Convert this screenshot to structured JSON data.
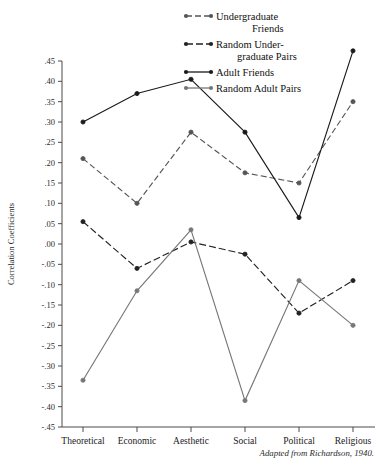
{
  "chart_data": {
    "type": "line",
    "title": "",
    "xlabel": "",
    "ylabel": "Correlation Coefficients",
    "categories": [
      "Theoretical",
      "Economic",
      "Aesthetic",
      "Social",
      "Political",
      "Religious"
    ],
    "ylim": [
      -0.45,
      0.45
    ],
    "ytick_step": 0.05,
    "ytick_labels": [
      ".45",
      ".40",
      ".35",
      ".30",
      ".25",
      ".20",
      ".15",
      ".10",
      ".05",
      ".00",
      "-.05",
      "-.10",
      "-.15",
      "-.20",
      "-.25",
      "-.30",
      "-.35",
      "-.40",
      "-.45"
    ],
    "ytick_values": [
      0.45,
      0.4,
      0.35,
      0.3,
      0.25,
      0.2,
      0.15,
      0.1,
      0.05,
      0.0,
      -0.05,
      -0.1,
      -0.15,
      -0.2,
      -0.25,
      -0.3,
      -0.35,
      -0.4,
      -0.45
    ],
    "grid": false,
    "legend_position": "top-center",
    "series": [
      {
        "name": "Undergraduate Friends",
        "label_lines": [
          "Undergraduate",
          "Friends"
        ],
        "color": "#555555",
        "dash": "6,3",
        "marker": "circle",
        "values": [
          0.21,
          0.1,
          0.275,
          0.175,
          0.15,
          0.35
        ]
      },
      {
        "name": "Random Undergraduate Pairs",
        "label_lines": [
          "Random Under-",
          "graduate Pairs"
        ],
        "color": "#222222",
        "dash": "7,3",
        "marker": "circle",
        "values": [
          0.055,
          -0.06,
          0.005,
          -0.025,
          -0.17,
          -0.09
        ]
      },
      {
        "name": "Adult Friends",
        "label_lines": [
          "Adult Friends"
        ],
        "color": "#1a1a1a",
        "dash": "0",
        "marker": "circle",
        "values": [
          0.3,
          0.37,
          0.405,
          0.275,
          0.065,
          0.475
        ]
      },
      {
        "name": "Random Adult Pairs",
        "label_lines": [
          "Random Adult Pairs"
        ],
        "color": "#777777",
        "dash": "0",
        "marker": "circle",
        "values": [
          -0.335,
          -0.115,
          0.035,
          -0.385,
          -0.09,
          -0.2
        ]
      }
    ],
    "caption": "Adapted from Richardson, 1940."
  }
}
